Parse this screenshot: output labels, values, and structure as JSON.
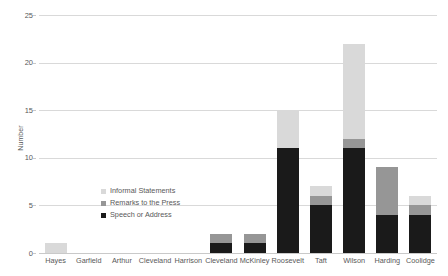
{
  "chart_data": {
    "type": "bar",
    "stacked": true,
    "title": "",
    "xlabel": "",
    "ylabel": "Number",
    "ylim": [
      0,
      25
    ],
    "yticks": [
      0,
      5,
      10,
      15,
      20,
      25
    ],
    "ytick_labels": [
      "0",
      "5",
      "10",
      "15",
      "20",
      "25"
    ],
    "grid": true,
    "legend_position": "inside-left",
    "categories": [
      "Hayes",
      "Garfield",
      "Arthur",
      "Cleveland",
      "Harrison",
      "Cleveland",
      "McKinley",
      "Roosevelt",
      "Taft",
      "Wilson",
      "Harding",
      "Coolidge"
    ],
    "series": [
      {
        "name": "Speech or Address",
        "color": "#1a1a1a",
        "values": [
          0,
          0,
          0,
          0,
          0,
          1,
          1,
          11,
          5,
          11,
          4,
          4
        ]
      },
      {
        "name": "Remarks to the Press",
        "color": "#969696",
        "values": [
          0,
          0,
          0,
          0,
          0,
          1,
          1,
          0,
          1,
          1,
          5,
          1
        ]
      },
      {
        "name": "Informal Statements",
        "color": "#d9d9d9",
        "values": [
          1,
          0,
          0,
          0,
          0,
          0,
          0,
          4,
          1,
          10,
          0,
          1
        ]
      }
    ],
    "totals": [
      1,
      0,
      0,
      0,
      0,
      2,
      2,
      15,
      7,
      22,
      9,
      6
    ]
  },
  "legend": {
    "items": [
      {
        "label": "Informal Statements",
        "color": "#d9d9d9"
      },
      {
        "label": "Remarks to the Press",
        "color": "#969696"
      },
      {
        "label": "Speech or Address",
        "color": "#1a1a1a"
      }
    ]
  },
  "axes": {
    "y_title": "Number"
  },
  "colors": {
    "gridline": "#d9d9d9",
    "axis_text": "#595959",
    "background": "#ffffff"
  }
}
